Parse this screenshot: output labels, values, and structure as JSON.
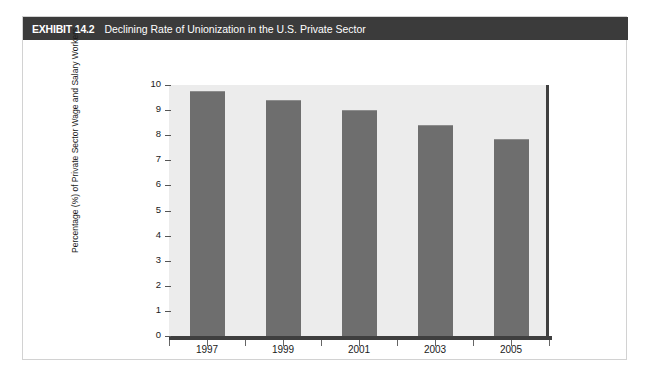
{
  "exhibit": {
    "label": "EXHIBIT 14.2",
    "title": "Declining Rate of Unionization in the U.S. Private Sector"
  },
  "chart_data": {
    "type": "bar",
    "title": "Declining Rate of Unionization in the U.S. Private Sector",
    "categories": [
      "1997",
      "1999",
      "2001",
      "2003",
      "2005"
    ],
    "values": [
      9.75,
      9.4,
      9.0,
      8.4,
      7.85
    ],
    "xlabel": "",
    "ylabel": "Percentage (%) of Private Sector Wage and Salary Workers",
    "ylim": [
      0,
      10
    ],
    "ytick_labels": [
      "10",
      "9",
      "8",
      "7",
      "6",
      "5",
      "4",
      "3",
      "2",
      "1",
      "0"
    ],
    "ytick_values": [
      10,
      9,
      8,
      7,
      6,
      5,
      4,
      3,
      2,
      1,
      0
    ],
    "grid": false,
    "legend": null,
    "bar_color": "#6e6e6e",
    "plot_background": "#ececec",
    "axis_color": "#3f3f3f"
  }
}
